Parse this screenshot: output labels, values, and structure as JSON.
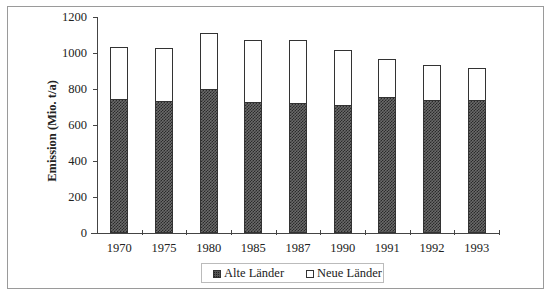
{
  "chart_data": {
    "type": "bar",
    "stacked": true,
    "title": "",
    "xlabel": "",
    "ylabel": "Emission  (Mio. t/a)",
    "ylim": [
      0,
      1200
    ],
    "yticks": [
      0,
      200,
      400,
      600,
      800,
      1000,
      1200
    ],
    "grid": false,
    "legend_position": "bottom",
    "categories": [
      "1970",
      "1975",
      "1980",
      "1985",
      "1987",
      "1990",
      "1991",
      "1992",
      "1993"
    ],
    "series": [
      {
        "name": "Alte Länder",
        "pattern": "dark-checkered",
        "values": [
          743,
          733,
          798,
          728,
          724,
          713,
          754,
          739,
          739
        ]
      },
      {
        "name": "Neue Länder",
        "pattern": "white",
        "values": [
          289,
          297,
          315,
          343,
          348,
          306,
          215,
          192,
          179
        ]
      }
    ],
    "totals": [
      1032,
      1030,
      1113,
      1071,
      1072,
      1019,
      969,
      931,
      918
    ]
  },
  "legend": {
    "items": [
      {
        "label": "Alte Länder",
        "icon": "dark-square-icon"
      },
      {
        "label": "Neue Länder",
        "icon": "white-square-icon"
      }
    ]
  }
}
